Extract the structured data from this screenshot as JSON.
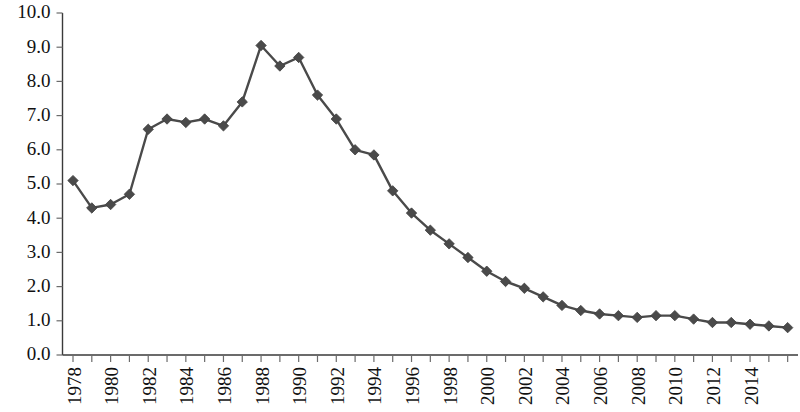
{
  "chart_data": {
    "type": "line",
    "title": "",
    "subtitle": "",
    "xlabel": "",
    "ylabel": "",
    "grid": false,
    "legend_position": "none",
    "marker": "diamond",
    "series_color": "#4a4a4a",
    "ylim": [
      0.0,
      10.0
    ],
    "ytick_interval": 1.0,
    "ytick_labels": [
      "0.0",
      "1.0",
      "2.0",
      "3.0",
      "4.0",
      "5.0",
      "6.0",
      "7.0",
      "8.0",
      "9.0",
      "10.0"
    ],
    "ytick_values": [
      0.0,
      1.0,
      2.0,
      3.0,
      4.0,
      5.0,
      6.0,
      7.0,
      8.0,
      9.0,
      10.0
    ],
    "xlim": [
      1978,
      2016
    ],
    "x": [
      1978,
      1979,
      1980,
      1981,
      1982,
      1983,
      1984,
      1985,
      1986,
      1987,
      1988,
      1989,
      1990,
      1991,
      1992,
      1993,
      1994,
      1995,
      1996,
      1997,
      1998,
      1999,
      2000,
      2001,
      2002,
      2003,
      2004,
      2005,
      2006,
      2007,
      2008,
      2009,
      2010,
      2011,
      2012,
      2013,
      2014,
      2015,
      2016
    ],
    "xtick_labels_visible": [
      "1978",
      "1980",
      "1982",
      "1984",
      "1986",
      "1988",
      "1990",
      "1992",
      "1994",
      "1996",
      "1998",
      "2000",
      "2002",
      "2004",
      "2006",
      "2008",
      "2010",
      "2012",
      "2014"
    ],
    "xtick_label_rotation": -90,
    "values": [
      5.1,
      4.3,
      4.4,
      4.7,
      6.6,
      6.9,
      6.8,
      6.9,
      6.7,
      7.4,
      9.05,
      8.45,
      8.7,
      7.6,
      6.9,
      6.0,
      5.85,
      4.8,
      4.15,
      3.65,
      3.25,
      2.85,
      2.45,
      2.15,
      1.95,
      1.7,
      1.45,
      1.3,
      1.2,
      1.15,
      1.1,
      1.15,
      1.15,
      1.05,
      0.95,
      0.95,
      0.9,
      0.85,
      0.8
    ]
  }
}
